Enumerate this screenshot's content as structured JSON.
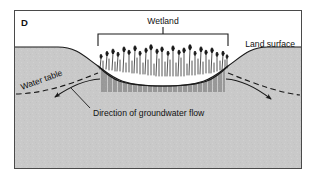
{
  "figure": {
    "panel_letter": "D",
    "type": "hydrogeologic cross-section",
    "labels": {
      "wetland": "Wetland",
      "land_surface": "Land surface",
      "water_table": "Water table",
      "flow_direction": "Direction of groundwater flow"
    },
    "colors": {
      "subsurface_fill": "#c9c9c9",
      "sky_fill": "#ffffff",
      "line": "#1a1a1a",
      "frame": "#4a4a4a",
      "page_background": "#ffffff"
    },
    "geometry": {
      "frame": {
        "x": 14,
        "y": 10,
        "width": 288,
        "height": 159
      },
      "bracket": {
        "left_x": 98,
        "right_x": 228,
        "top_y": 33,
        "bottom_y": 46,
        "tick_x": 163
      },
      "wetland_basin": {
        "left_x": 98,
        "right_x": 228,
        "rim_y": 66,
        "bottom_y": 86
      },
      "land_surface_left_edge_y": 47,
      "land_surface_right_edge_y": 47,
      "vegetation_stem_count": 62,
      "flow_arrow_left": {
        "from_x": 96,
        "from_y": 78,
        "to_x": 52,
        "to_y": 98
      },
      "flow_arrow_right": {
        "from_x": 230,
        "from_y": 78,
        "to_x": 274,
        "to_y": 100
      }
    }
  }
}
